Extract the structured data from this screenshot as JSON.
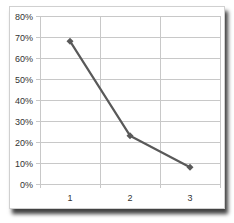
{
  "chart_data": {
    "type": "line",
    "title": "",
    "xlabel": "",
    "ylabel": "",
    "categories": [
      "1",
      "2",
      "3"
    ],
    "series": [
      {
        "name": "Series 1",
        "values": [
          0.68,
          0.23,
          0.08
        ],
        "color": "#595959",
        "marker": "diamond"
      }
    ],
    "ylim": [
      0,
      0.8
    ],
    "yticks": [
      "0%",
      "10%",
      "20%",
      "30%",
      "40%",
      "50%",
      "60%",
      "70%",
      "80%"
    ],
    "grid": {
      "horizontal": true,
      "vertical": true
    },
    "legend": "none"
  },
  "colors": {
    "line": "#595959",
    "grid": "#c8c8c8",
    "axis_text": "#333333"
  }
}
